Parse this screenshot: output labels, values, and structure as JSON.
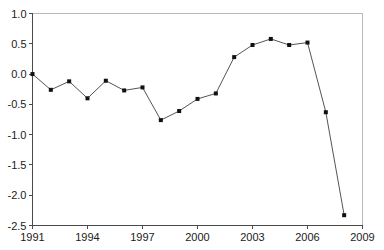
{
  "chart_data": {
    "type": "line",
    "title": "",
    "subtitle": "",
    "xlabel": "",
    "ylabel": "",
    "xlim": [
      1991,
      2009
    ],
    "ylim": [
      -2.5,
      1.0
    ],
    "grid": false,
    "legend": null,
    "legend_position": "none",
    "x_ticks": [
      "1991",
      "1994",
      "1997",
      "2000",
      "2003",
      "2006",
      "2009"
    ],
    "x_tick_values": [
      1991,
      1994,
      1997,
      2000,
      2003,
      2006,
      2009
    ],
    "y_ticks": [
      "1.0",
      "0.5",
      "0.0",
      "-0.5",
      "-1.0",
      "-1.5",
      "-2.0",
      "-2.5"
    ],
    "y_tick_values": [
      1.0,
      0.5,
      0.0,
      -0.5,
      -1.0,
      -1.5,
      -2.0,
      -2.5
    ],
    "marker": "square",
    "line_color": "#555555",
    "marker_color": "#111111",
    "x": [
      1991,
      1992,
      1993,
      1994,
      1995,
      1996,
      1997,
      1998,
      1999,
      2000,
      2001,
      2002,
      2003,
      2004,
      2005,
      2006,
      2007,
      2008
    ],
    "values": [
      0.0,
      -0.26,
      -0.12,
      -0.4,
      -0.11,
      -0.27,
      -0.22,
      -0.76,
      -0.61,
      -0.41,
      -0.32,
      0.28,
      0.48,
      0.58,
      0.48,
      0.52,
      -0.63,
      -2.33
    ],
    "series": [
      {
        "name": "series-1",
        "values": [
          0.0,
          -0.26,
          -0.12,
          -0.4,
          -0.11,
          -0.27,
          -0.22,
          -0.76,
          -0.61,
          -0.41,
          -0.32,
          0.28,
          0.48,
          0.58,
          0.48,
          0.52,
          -0.63,
          -2.33
        ]
      }
    ]
  }
}
